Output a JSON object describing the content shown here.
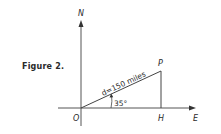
{
  "figure": {
    "caption": "Figure 2.",
    "axes": {
      "north_label": "N",
      "east_label": "E",
      "origin_label": "O"
    },
    "points": {
      "p_label": "P",
      "h_label": "H"
    },
    "distance_label": "d=150 miles",
    "angle_label": "35°"
  }
}
